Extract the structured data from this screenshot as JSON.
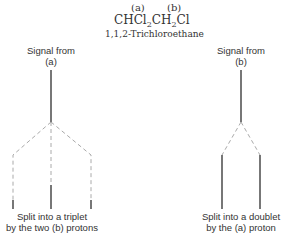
{
  "compound": {
    "labels": [
      "(a)",
      "(b)"
    ],
    "formula_parts": [
      "CH",
      "Cl",
      "2",
      "CH",
      "2",
      "Cl"
    ],
    "name": "1,1,2-Trichloroethane"
  },
  "left": {
    "title_line1": "Signal from",
    "title_line2": "(a)",
    "caption_line1": "Split into a triplet",
    "caption_line2": "by the two (b) protons",
    "pattern": "triplet"
  },
  "right": {
    "title_line1": "Signal from",
    "title_line2": "(b)",
    "caption_line1": "Split into a doublet",
    "caption_line2": "by the (a) proton",
    "pattern": "doublet"
  },
  "colors": {
    "solid_line": "#777777",
    "dashed_line": "#aaaaaa",
    "text": "#333333"
  }
}
